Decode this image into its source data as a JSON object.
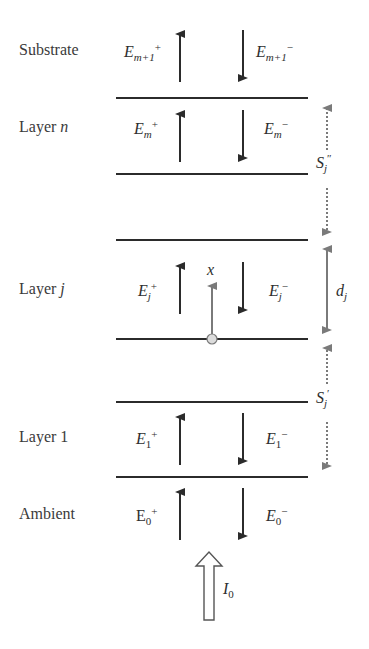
{
  "diagram": {
    "layers": [
      {
        "name": "Substrate",
        "label": "Substrate",
        "label_italic_part": "",
        "field_up": {
          "base": "E",
          "sub": "m+1",
          "sup": "+"
        },
        "field_down": {
          "base": "E",
          "sub": "m+1",
          "sup": "−"
        }
      },
      {
        "name": "Layer n",
        "label": "Layer ",
        "label_italic_part": "n",
        "field_up": {
          "base": "E",
          "sub": "m",
          "sup": "+"
        },
        "field_down": {
          "base": "E",
          "sub": "m",
          "sup": "−"
        }
      },
      {
        "name": "Layer j",
        "label": "Layer ",
        "label_italic_part": "j",
        "field_up": {
          "base": "E",
          "sub": "j",
          "sup": "+"
        },
        "field_down": {
          "base": "E",
          "sub": "j",
          "sup": "−"
        }
      },
      {
        "name": "Layer 1",
        "label": "Layer 1",
        "label_italic_part": "",
        "field_up": {
          "base": "E",
          "sub": "1",
          "sup": "+"
        },
        "field_down": {
          "base": "E",
          "sub": "1",
          "sup": "−"
        }
      },
      {
        "name": "Ambient",
        "label": "Ambient",
        "label_italic_part": "",
        "field_up": {
          "base": "E",
          "sub": "0",
          "sup": "+"
        },
        "field_down": {
          "base": "E",
          "sub": "0",
          "sup": "−"
        }
      }
    ],
    "position_axis_label": "x",
    "thickness_label": {
      "base": "d",
      "sub": "j"
    },
    "upper_stack_label": {
      "base": "S",
      "sub": "j",
      "sup": "″"
    },
    "lower_stack_label": {
      "base": "S",
      "sub": "j",
      "sup": "′"
    },
    "incident_label": {
      "base": "I",
      "sub": "0"
    },
    "colors": {
      "line": "#2b2b2b",
      "field_arrow": "#2b2b2b",
      "dimension_arrow": "#7a7a7a",
      "origin_circle_fill": "#dcdcdc",
      "text": "#3a3a3a"
    }
  }
}
